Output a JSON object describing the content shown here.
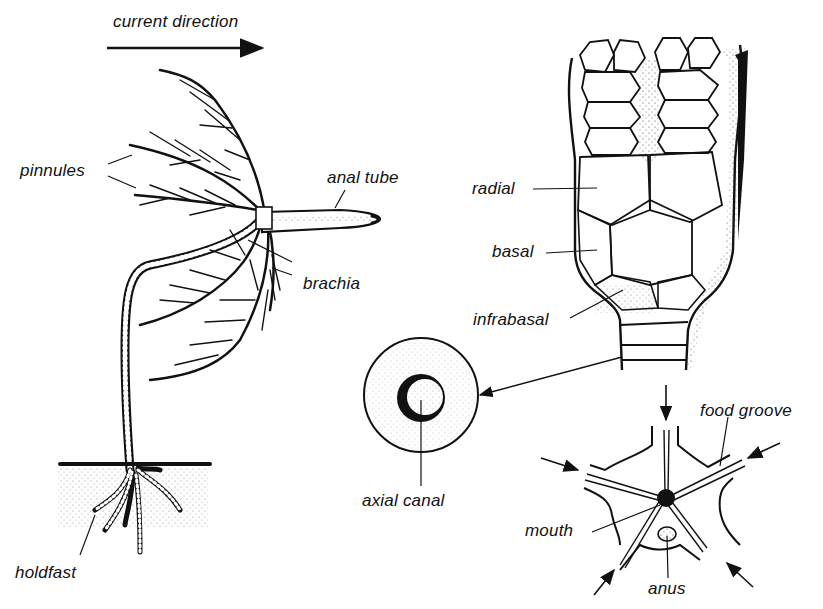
{
  "diagram": {
    "colors": {
      "ink": "#111111",
      "background": "#ffffff",
      "stipple": "#555555"
    },
    "panels": [
      {
        "id": "whole-animal",
        "title": ""
      },
      {
        "id": "calyx",
        "title": ""
      },
      {
        "id": "stem-section",
        "title": ""
      },
      {
        "id": "oral-surface",
        "title": ""
      }
    ],
    "labels": {
      "current_direction": "current direction",
      "pinnules": "pinnules",
      "anal_tube": "anal tube",
      "brachia": "brachia",
      "holdfast": "holdfast",
      "radial": "radial",
      "basal": "basal",
      "infrabasal": "infrabasal",
      "axial_canal": "axial canal",
      "food_groove": "food groove",
      "mouth": "mouth",
      "anus": "anus"
    }
  }
}
